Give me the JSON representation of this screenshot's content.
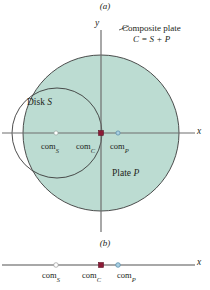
{
  "figure": {
    "panels": [
      {
        "id": "a",
        "label": "(a)"
      },
      {
        "id": "b",
        "label": "(b)"
      }
    ],
    "colors": {
      "plate_fill": "#bcdcd2",
      "plate_stroke": "#3a3a3a",
      "axis": "#6e6e6e",
      "com_c_marker": "#8c1a36",
      "com_p_marker": "#6fa8c8",
      "com_s_marker": "#ffffff",
      "text": "#231f20"
    }
  },
  "panel_a": {
    "callout": {
      "line1": "Composite plate",
      "line2": "C = S + P"
    },
    "disk_label_text": "Disk ",
    "disk_label_symbol": "S",
    "plate_label_text": "Plate ",
    "plate_label_symbol": "P",
    "axes": {
      "y_label": "y",
      "x_label": "x"
    },
    "com_points": [
      {
        "name": "com_S",
        "text": "com",
        "sub": "S",
        "marker": "open-circle",
        "x": 56,
        "y": 133
      },
      {
        "name": "com_C",
        "text": "com",
        "sub": "C",
        "marker": "filled-square",
        "x": 101,
        "y": 133
      },
      {
        "name": "com_P",
        "text": "com",
        "sub": "P",
        "marker": "blue-circle",
        "x": 118,
        "y": 133
      }
    ],
    "geometry": {
      "composite_circle": {
        "cx": 101,
        "cy": 133,
        "r": 78
      },
      "disk_circle": {
        "cx": 57,
        "cy": 133,
        "r": 45
      },
      "y_axis_x": 101,
      "x_axis_y": 133
    }
  },
  "panel_b": {
    "axes": {
      "x_label": "x"
    },
    "com_points": [
      {
        "name": "com_S",
        "text": "com",
        "sub": "S",
        "marker": "open-circle",
        "x": 56,
        "y": 265
      },
      {
        "name": "com_C",
        "text": "com",
        "sub": "C",
        "marker": "filled-square",
        "x": 101,
        "y": 265
      },
      {
        "name": "com_P",
        "text": "com",
        "sub": "P",
        "marker": "blue-circle",
        "x": 118,
        "y": 265
      }
    ],
    "axis_line": {
      "x1": 2,
      "x2": 196,
      "y": 265
    }
  }
}
